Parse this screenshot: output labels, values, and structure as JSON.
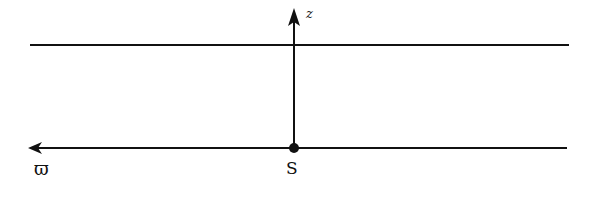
{
  "diagram": {
    "labels": {
      "z_axis": "z",
      "source_point": "S",
      "radial_axis": "ϖ"
    },
    "colors": {
      "line": "#111111",
      "background": "#ffffff"
    },
    "elements": {
      "upper_line": {
        "x1": 30,
        "y1": 45,
        "x2": 569,
        "y2": 45
      },
      "lower_line": {
        "x1": 30,
        "y1": 148,
        "x2": 567,
        "y2": 148
      },
      "z_axis": {
        "x": 294,
        "y_from": 148,
        "y_to": 10
      },
      "source_point": {
        "x": 294,
        "y": 148
      }
    }
  }
}
